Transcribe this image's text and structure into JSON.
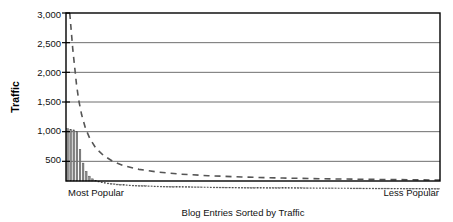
{
  "chart_data": {
    "type": "bar",
    "title": "",
    "xlabel": "Blog Entries Sorted by Traffic",
    "ylabel": "Traffic",
    "ylim": [
      0,
      3000
    ],
    "yticks": [
      500,
      1000,
      1500,
      2000,
      2500,
      3000
    ],
    "ytick_labels": [
      "500",
      "1,000",
      "1,500",
      "2,000",
      "2,500",
      "3,000"
    ],
    "grid": "horizontal",
    "legend": "none",
    "x_axis_endpoints": {
      "left": "Most Popular",
      "right": "Less Popular"
    },
    "series": [
      {
        "name": "Traffic per blog entry",
        "type": "bar",
        "values": [
          1050,
          1040,
          1030,
          1000,
          700,
          470,
          330,
          250,
          205,
          180,
          165,
          152,
          142,
          134,
          127,
          121,
          116,
          112,
          108,
          104,
          101,
          98,
          96,
          93,
          91,
          89,
          87,
          86,
          84,
          83,
          81,
          80,
          79,
          78,
          77,
          76,
          75,
          74,
          73,
          72,
          71,
          70,
          70,
          69,
          68,
          68,
          67,
          66,
          66,
          65,
          65,
          64,
          64,
          63,
          63,
          62,
          62,
          61,
          61,
          60,
          60,
          60,
          59,
          59,
          58,
          58,
          58,
          57,
          57,
          57,
          56,
          56,
          56,
          55,
          55,
          55,
          54,
          54,
          54,
          54,
          53,
          53,
          53,
          52,
          52,
          52,
          52,
          51,
          51,
          51,
          51,
          50,
          50,
          50,
          50,
          49,
          49,
          49,
          49,
          48,
          48,
          48,
          48,
          48,
          47,
          47,
          47,
          47,
          46,
          46,
          46,
          46,
          46,
          45,
          45,
          45,
          45,
          45,
          44,
          44
        ]
      },
      {
        "name": "Power-law trend",
        "type": "line",
        "style": "dashed",
        "x_fraction": [
          0.01,
          0.014,
          0.018,
          0.023,
          0.028,
          0.034,
          0.042,
          0.052,
          0.064,
          0.08,
          0.1,
          0.125,
          0.155,
          0.195,
          0.245,
          0.305,
          0.38,
          0.47,
          0.58,
          0.71,
          0.86,
          1.0
        ],
        "values": [
          3000,
          2700,
          2400,
          2100,
          1800,
          1530,
          1280,
          1060,
          880,
          720,
          600,
          500,
          425,
          365,
          320,
          285,
          258,
          236,
          218,
          204,
          193,
          185
        ]
      }
    ]
  },
  "axis": {
    "y_title": "Traffic",
    "x_title": "Blog Entries Sorted by Traffic",
    "x_left_label": "Most Popular",
    "x_right_label": "Less Popular",
    "tick_0": "3,000",
    "tick_1": "2,500",
    "tick_2": "2,000",
    "tick_3": "1,500",
    "tick_4": "1,000",
    "tick_5": "500"
  },
  "colors": {
    "bar_fill": "#8d8d8d",
    "bar_edge": "#4a4a4a",
    "axis": "#000000",
    "grid": "#6f6f6f",
    "trend": "#555555",
    "text": "#111111"
  }
}
